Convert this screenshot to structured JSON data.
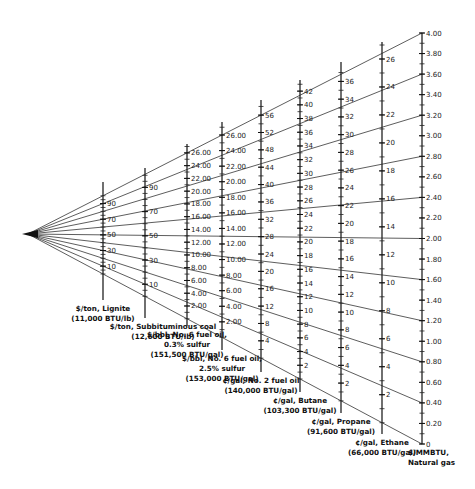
{
  "chart_data": {
    "type": "nomogram",
    "title": "",
    "origin_point": {
      "x": 28,
      "y": 234
    },
    "axes": [
      {
        "id": "lignite",
        "title_lines": [
          "$/ton, Lignite",
          "(11,000 BTU/lb)"
        ],
        "unit": "$/ton",
        "x": 103,
        "y_top": 182,
        "y_bottom": 300,
        "min": 0,
        "max": 100,
        "label_step": 20,
        "label_start": 10,
        "minor_step": 5,
        "labels": [
          "10",
          "30",
          "50",
          "70",
          "90"
        ]
      },
      {
        "id": "subbituminous-coal",
        "title_lines": [
          "$/ton, Subbituminous coal",
          "(12,600 BTU/lb)"
        ],
        "unit": "$/ton",
        "x": 145,
        "y_top": 168,
        "y_bottom": 318,
        "min": 0,
        "max": 100,
        "label_step": 20,
        "label_start": 10,
        "minor_step": 5,
        "labels": [
          "10",
          "30",
          "50",
          "70",
          "90"
        ]
      },
      {
        "id": "no6-fuel-oil-03",
        "title_lines": [
          "$/bbl, No. 6 fuel oil,",
          "0.3% sulfur",
          "(151,500 BTU/gal)"
        ],
        "unit": "$/bbl",
        "x": 187,
        "y_top": 144,
        "y_bottom": 326,
        "min": 0,
        "max": 27,
        "label_step": 2,
        "label_start": 2,
        "minor_step": 1,
        "labels": [
          "2.00",
          "4.00",
          "6.00",
          "8.00",
          "10.00",
          "12.00",
          "14.00",
          "16.00",
          "18.00",
          "20.00",
          "22.00",
          "24.00",
          "26.00"
        ]
      },
      {
        "id": "no6-fuel-oil-25",
        "title_lines": [
          "$/bbl, No. 6 fuel oil,",
          "2.5% sulfur",
          "(153,000 BTU/gal)"
        ],
        "unit": "$/bbl",
        "x": 222,
        "y_top": 122,
        "y_bottom": 350,
        "min": 0,
        "max": 27,
        "label_step": 2,
        "label_start": 2,
        "minor_step": 1,
        "labels": [
          "2.00",
          "4.00",
          "6.00",
          "8.00",
          "10.00",
          "12.00",
          "14.00",
          "16.00",
          "18.00",
          "20.00",
          "22.00",
          "24.00",
          "26.00"
        ]
      },
      {
        "id": "no2-fuel-oil",
        "title_lines": [
          "¢/gal, No. 2 fuel oil",
          "(140,000 BTU/gal)"
        ],
        "unit": "¢/gal",
        "x": 261,
        "y_top": 100,
        "y_bottom": 372,
        "min": 0,
        "max": 58,
        "label_step": 4,
        "label_start": 4,
        "minor_step": 2,
        "labels": [
          "4",
          "8",
          "12",
          "16",
          "20",
          "24",
          "28",
          "32",
          "36",
          "40",
          "44",
          "48",
          "52",
          "56"
        ]
      },
      {
        "id": "butane",
        "title_lines": [
          "¢/gal, Butane",
          "(103,300 BTU/gal)"
        ],
        "unit": "¢/gal",
        "x": 300,
        "y_top": 80,
        "y_bottom": 392,
        "min": 0,
        "max": 43,
        "label_step": 2,
        "label_start": 2,
        "minor_step": 1,
        "labels": [
          "2",
          "4",
          "6",
          "8",
          "10",
          "12",
          "14",
          "16",
          "18",
          "20",
          "22",
          "24",
          "26",
          "28",
          "30",
          "32",
          "34",
          "36",
          "38",
          "40",
          "42"
        ]
      },
      {
        "id": "propane",
        "title_lines": [
          "¢/gal, Propane",
          "(91,600 BTU/gal)"
        ],
        "unit": "¢/gal",
        "x": 341,
        "y_top": 62,
        "y_bottom": 413,
        "min": 0,
        "max": 37,
        "label_step": 2,
        "label_start": 2,
        "minor_step": 1,
        "labels": [
          "2",
          "4",
          "6",
          "8",
          "10",
          "12",
          "14",
          "16",
          "18",
          "20",
          "22",
          "24",
          "26",
          "28",
          "30",
          "32",
          "34",
          "36"
        ]
      },
      {
        "id": "ethane",
        "title_lines": [
          "¢/gal, Ethane",
          "(66,000 BTU/gal)"
        ],
        "unit": "¢/gal",
        "x": 382,
        "y_top": 42,
        "y_bottom": 434,
        "min": 0,
        "max": 27,
        "label_step": 2,
        "label_start": 2,
        "minor_step": 1,
        "labels": [
          "2",
          "4",
          "6",
          "8",
          "10",
          "12",
          "14",
          "16",
          "18",
          "20",
          "22",
          "24",
          "26"
        ]
      },
      {
        "id": "natural-gas",
        "title_lines": [
          "$/MMBTU,",
          "Natural gas"
        ],
        "unit": "$/MMBTU",
        "x": 422,
        "y_top": 33,
        "y_bottom": 444,
        "min": 0,
        "max": 4.0,
        "label_step": 0.2,
        "label_start": 0,
        "minor_step": 0.1,
        "labels": [
          "0",
          "0.20",
          "0.40",
          "0.60",
          "0.80",
          "1.00",
          "1.20",
          "1.40",
          "1.60",
          "1.80",
          "2.00",
          "2.20",
          "2.40",
          "2.60",
          "2.80",
          "3.00",
          "3.20",
          "3.40",
          "3.60",
          "3.80",
          "4.00"
        ]
      }
    ],
    "rays_to_natural_gas_values": [
      0,
      0.4,
      0.8,
      1.2,
      1.6,
      2.0,
      2.4,
      2.8,
      3.2,
      3.6,
      4.0
    ],
    "grid": false,
    "legend": null
  }
}
